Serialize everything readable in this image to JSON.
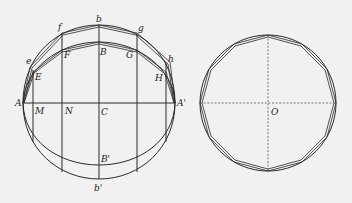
{
  "figure": {
    "left": {
      "labels": {
        "b": "b",
        "f": "f",
        "g": "g",
        "e": "e",
        "h": "h",
        "B": "B",
        "F": "F",
        "G": "G",
        "E": "E",
        "H": "H",
        "A": "A",
        "A_prime": "A'",
        "M": "M",
        "N": "N",
        "C": "C",
        "B_prime": "B'",
        "b_prime": "b'"
      }
    },
    "right": {
      "labels": {
        "O": "O"
      }
    },
    "colors": {
      "stroke": "#2a2a2a",
      "background": "#f1f1f1"
    }
  }
}
